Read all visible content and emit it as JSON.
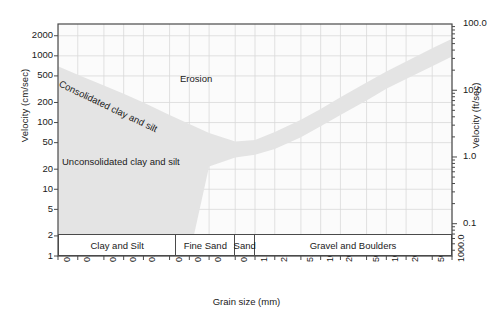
{
  "chart_data": {
    "type": "area",
    "title": "",
    "xlabel": "Grain size (mm)",
    "ylabel": "Velocity (cm/sec)",
    "ylabel_right": "Velocity (ft/sec)",
    "xscale": "log",
    "yscale": "log",
    "xlim": [
      0.001,
      1000.0
    ],
    "ylim": [
      1,
      3000
    ],
    "ylim_right": [
      0.0328,
      98.4
    ],
    "grid": true,
    "legend": "none",
    "x_ticks": [
      "0.001",
      "0.002",
      "0.005",
      "0.01",
      "0.02",
      "0.05",
      "0.1",
      "0.2",
      "0.5",
      "1.0",
      "2.0",
      "5.0",
      "10.0",
      "20.0",
      "50.0",
      "100.0",
      "200.0",
      "500.0",
      "1000.0"
    ],
    "x_tick_values": [
      0.001,
      0.002,
      0.005,
      0.01,
      0.02,
      0.05,
      0.1,
      0.2,
      0.5,
      1.0,
      2.0,
      5.0,
      10.0,
      20.0,
      50.0,
      100.0,
      200.0,
      500.0,
      1000.0
    ],
    "y_ticks_left": [
      "2000",
      "1000",
      "500",
      "200",
      "100",
      "50",
      "20",
      "10",
      "5",
      "2",
      "1"
    ],
    "y_tick_values_left": [
      2000,
      1000,
      500,
      200,
      100,
      50,
      20,
      10,
      5,
      2,
      1
    ],
    "y_ticks_right": [
      "100.0",
      "10.0",
      "1.0",
      "0.1"
    ],
    "y_tick_values_right": [
      100.0,
      10.0,
      1.0,
      0.1
    ],
    "series": [
      {
        "name": "critical erosion velocity band (upper bound)",
        "x": [
          0.001,
          0.002,
          0.005,
          0.01,
          0.02,
          0.05,
          0.1,
          0.2,
          0.5,
          1.0,
          2.0,
          5.0,
          10.0,
          20.0,
          50.0,
          100.0,
          200.0,
          500.0,
          1000.0
        ],
        "y": [
          700,
          520,
          360,
          270,
          200,
          130,
          95,
          70,
          52,
          55,
          72,
          110,
          160,
          240,
          400,
          580,
          820,
          1300,
          1800
        ]
      },
      {
        "name": "critical erosion velocity band (lower bound)",
        "x": [
          0.001,
          0.002,
          0.005,
          0.01,
          0.02,
          0.05,
          0.1,
          0.2,
          0.5,
          1.0,
          2.0,
          5.0,
          10.0,
          20.0,
          50.0,
          100.0,
          200.0,
          500.0,
          1000.0
        ],
        "y": [
          1,
          1,
          1,
          1,
          1,
          1,
          1,
          22,
          30,
          33,
          40,
          60,
          88,
          130,
          215,
          320,
          450,
          700,
          980
        ]
      }
    ],
    "annotations": [
      {
        "text": "Consolidated clay and silt",
        "x": 0.0015,
        "y": 330,
        "rotation": -25.5
      },
      {
        "text": "Unconsolidated clay and silt",
        "x": 0.0015,
        "y": 22
      },
      {
        "text": "Erosion",
        "x": 0.12,
        "y": 330
      }
    ],
    "categories": [
      {
        "label": "Clay and Silt",
        "x_start": 0.001,
        "x_end": 0.0625
      },
      {
        "label": "Fine Sand",
        "x_start": 0.0625,
        "x_end": 0.5
      },
      {
        "label": "Sand",
        "x_start": 0.5,
        "x_end": 1.0
      },
      {
        "label": "Gravel and Boulders",
        "x_start": 1.0,
        "x_end": 1000.0
      }
    ],
    "colors": {
      "band_fill": "#e4e4e4",
      "grid": "#d9d9d9",
      "frame": "#4a4a4a",
      "text": "#1a1a1a",
      "plot_bg": "#fbfbfb"
    }
  },
  "axes": {
    "left_title": "Velocity (cm/sec)",
    "right_title": "Velocity (ft/sec)",
    "bottom_title": "Grain size (mm)"
  }
}
